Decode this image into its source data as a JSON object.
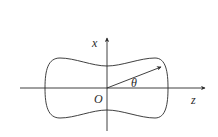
{
  "diagram": {
    "type": "polar-curve-with-axes",
    "axes": {
      "horizontal": {
        "label": "z"
      },
      "vertical": {
        "label": "x"
      }
    },
    "origin": {
      "label": "O"
    },
    "angle": {
      "label": "θ"
    },
    "curve": {
      "shape": "peanut / dumbbell-shaped closed curve symmetric about both axes"
    },
    "radius_vector": {
      "description": "arrow from origin O to curve at angle θ"
    },
    "colors": {
      "stroke": "#2a2a2a",
      "background": "#ffffff"
    }
  }
}
